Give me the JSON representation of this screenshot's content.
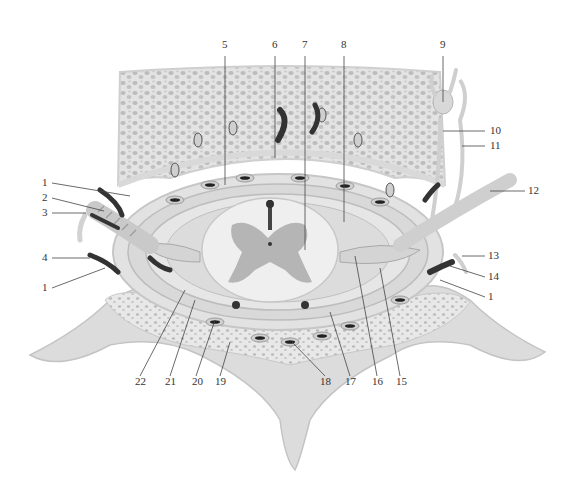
{
  "diagram": {
    "type": "anatomical-cross-section",
    "colors": {
      "background": "#ffffff",
      "bone_fill": "#e3e3e3",
      "bone_pores": "#b9b9b9",
      "membrane": "#d6d6d6",
      "cord_white": "#efefef",
      "gray_matter": "#b5b5b5",
      "vessel_dark": "#3a3a3a",
      "leader_line": "#444444"
    },
    "labels": [
      {
        "id": "1",
        "text": "1",
        "x": 42,
        "y": 183
      },
      {
        "id": "2",
        "text": "2",
        "x": 42,
        "y": 198
      },
      {
        "id": "3",
        "text": "3",
        "x": 42,
        "y": 213
      },
      {
        "id": "4",
        "text": "4",
        "x": 42,
        "y": 258
      },
      {
        "id": "1b",
        "text": "1",
        "x": 42,
        "y": 288
      },
      {
        "id": "5",
        "text": "5",
        "x": 222,
        "y": 45
      },
      {
        "id": "6",
        "text": "6",
        "x": 272,
        "y": 45
      },
      {
        "id": "7",
        "text": "7",
        "x": 302,
        "y": 45
      },
      {
        "id": "8",
        "text": "8",
        "x": 341,
        "y": 45
      },
      {
        "id": "9",
        "text": "9",
        "x": 440,
        "y": 45
      },
      {
        "id": "10",
        "text": "10",
        "x": 490,
        "y": 131
      },
      {
        "id": "11",
        "text": "11",
        "x": 490,
        "y": 146
      },
      {
        "id": "12",
        "text": "12",
        "x": 528,
        "y": 191
      },
      {
        "id": "13",
        "text": "13",
        "x": 488,
        "y": 256
      },
      {
        "id": "14",
        "text": "14",
        "x": 488,
        "y": 277
      },
      {
        "id": "1c",
        "text": "1",
        "x": 488,
        "y": 297
      },
      {
        "id": "15",
        "text": "15",
        "x": 396,
        "y": 382
      },
      {
        "id": "16",
        "text": "16",
        "x": 372,
        "y": 382
      },
      {
        "id": "17",
        "text": "17",
        "x": 345,
        "y": 382
      },
      {
        "id": "18",
        "text": "18",
        "x": 320,
        "y": 382
      },
      {
        "id": "19",
        "text": "19",
        "x": 215,
        "y": 382
      },
      {
        "id": "20",
        "text": "20",
        "x": 192,
        "y": 382
      },
      {
        "id": "21",
        "text": "21",
        "x": 165,
        "y": 382
      },
      {
        "id": "22",
        "text": "22",
        "x": 135,
        "y": 382
      }
    ]
  }
}
